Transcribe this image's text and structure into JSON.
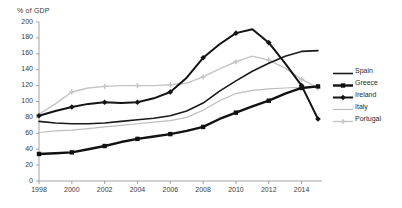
{
  "chart_data": {
    "type": "line",
    "title": "",
    "ylabel": "% of GDP",
    "xlabel": "",
    "ylim": [
      0,
      200
    ],
    "xlim": [
      1998,
      2015
    ],
    "grid": false,
    "legend_position": "right",
    "ytick_labels": [
      "200",
      "180",
      "160",
      "140",
      "120",
      "100",
      "80",
      "60",
      "40",
      "20",
      "0"
    ],
    "yticks": [
      200,
      180,
      160,
      140,
      120,
      100,
      80,
      60,
      40,
      20,
      0
    ],
    "xtick_labels": [
      "1998",
      "2000",
      "2002",
      "2004",
      "2006",
      "2008",
      "2010",
      "2012",
      "2014"
    ],
    "xticks": [
      1998,
      2000,
      2002,
      2004,
      2006,
      2008,
      2010,
      2012,
      2014
    ],
    "x": [
      1998,
      1999,
      2000,
      2001,
      2002,
      2003,
      2004,
      2005,
      2006,
      2007,
      2008,
      2009,
      2010,
      2011,
      2012,
      2013,
      2014,
      2015
    ],
    "series": [
      {
        "name": "Spain",
        "color": "#1a1a1a",
        "width": 1.6,
        "marker": "none",
        "values": [
          75,
          73,
          72,
          72,
          73,
          75,
          77,
          79,
          82,
          88,
          98,
          113,
          126,
          138,
          148,
          157,
          163,
          164
        ]
      },
      {
        "name": "Greece",
        "color": "#111111",
        "width": 2.4,
        "marker": "square",
        "values": [
          34,
          35,
          36,
          40,
          44,
          49,
          53,
          56,
          59,
          63,
          68,
          78,
          86,
          94,
          101,
          110,
          117,
          119
        ]
      },
      {
        "name": "Ireland",
        "color": "#141414",
        "width": 2.0,
        "marker": "diamond",
        "values": [
          82,
          88,
          93,
          97,
          99,
          98,
          99,
          104,
          112,
          130,
          155,
          172,
          186,
          191,
          174,
          148,
          120,
          78
        ]
      },
      {
        "name": "Italy",
        "color": "#bdbdbd",
        "width": 1.2,
        "marker": "none",
        "values": [
          61,
          63,
          64,
          66,
          68,
          70,
          72,
          74,
          76,
          80,
          89,
          101,
          110,
          114,
          116,
          117,
          118,
          118
        ]
      },
      {
        "name": "Portugal",
        "color": "#c4c4c4",
        "width": 1.4,
        "marker": "cross",
        "values": [
          84,
          97,
          112,
          117,
          119,
          120,
          120,
          120,
          121,
          123,
          131,
          141,
          150,
          157,
          152,
          142,
          128,
          117
        ]
      }
    ]
  },
  "legend": {
    "items": [
      {
        "label": "Spain"
      },
      {
        "label": "Greece"
      },
      {
        "label": "Ireland"
      },
      {
        "label": "Italy"
      },
      {
        "label": "Portugal"
      }
    ]
  }
}
